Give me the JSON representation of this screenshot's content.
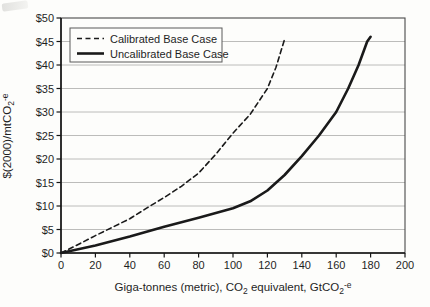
{
  "chart_data": {
    "type": "line",
    "title": "",
    "xlabel_parts": [
      "Giga-tonnes (metric), CO",
      "2",
      " equivalent, GtCO",
      "2",
      "-e"
    ],
    "ylabel_parts": [
      "$(2000)/mtCO",
      "2",
      "-e"
    ],
    "xlim": [
      0,
      200
    ],
    "ylim": [
      0,
      50
    ],
    "xticks": [
      0,
      20,
      40,
      60,
      80,
      100,
      120,
      140,
      160,
      180,
      200
    ],
    "xtick_labels": [
      "0",
      "20",
      "40",
      "60",
      "80",
      "100",
      "120",
      "140",
      "160",
      "180",
      "200"
    ],
    "yticks": [
      0,
      5,
      10,
      15,
      20,
      25,
      30,
      35,
      40,
      45,
      50
    ],
    "ytick_labels": [
      "$0",
      "$5",
      "$10",
      "$15",
      "$20",
      "$25",
      "$30",
      "$35",
      "$40",
      "$45",
      "$50"
    ],
    "grid": "horizontal",
    "legend_position": "top-left",
    "series": [
      {
        "name": "Calibrated Base Case",
        "style": "dashed",
        "points": [
          [
            0,
            0
          ],
          [
            10,
            1.8
          ],
          [
            20,
            3.7
          ],
          [
            30,
            5.5
          ],
          [
            40,
            7.3
          ],
          [
            50,
            9.6
          ],
          [
            60,
            11.8
          ],
          [
            70,
            14.2
          ],
          [
            80,
            17.0
          ],
          [
            90,
            21.0
          ],
          [
            100,
            25.5
          ],
          [
            110,
            29.5
          ],
          [
            120,
            35.0
          ],
          [
            125,
            39.5
          ],
          [
            130,
            45.5
          ]
        ]
      },
      {
        "name": "Uncalibrated Base Case",
        "style": "solid",
        "points": [
          [
            0,
            0
          ],
          [
            20,
            1.6
          ],
          [
            40,
            3.5
          ],
          [
            60,
            5.6
          ],
          [
            80,
            7.5
          ],
          [
            100,
            9.5
          ],
          [
            110,
            11.0
          ],
          [
            120,
            13.3
          ],
          [
            130,
            16.6
          ],
          [
            140,
            20.6
          ],
          [
            150,
            25.0
          ],
          [
            160,
            30.0
          ],
          [
            167,
            35.0
          ],
          [
            173,
            40.0
          ],
          [
            178,
            45.0
          ],
          [
            180,
            46.0
          ]
        ]
      }
    ]
  },
  "colors": {
    "curve": "#1a1a1a",
    "gridline": "#bcbcba",
    "frame": "#4a4a4a",
    "axis": "#161616",
    "tick_text": "#242424",
    "legend_border": "#5a5a5a",
    "legend_fill": "#fdfdfb"
  }
}
